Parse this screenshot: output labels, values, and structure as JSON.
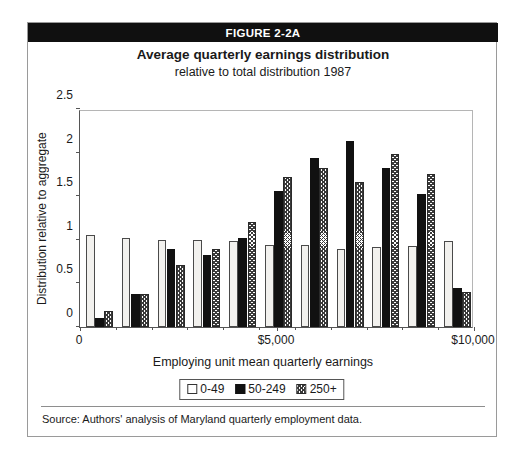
{
  "figure": {
    "header_label": "FIGURE 2-2A",
    "title": "Average quarterly earnings distribution",
    "subtitle": "relative to total distribution 1987",
    "source_note": "Source: Authors' analysis of Maryland quarterly employment data."
  },
  "colors": {
    "header_background": "#101010",
    "header_text": "#ffffff",
    "series_0_49": "#f2f1ee",
    "series_50_249": "#111111",
    "series_250_plus": "#9a9a9a",
    "axis": "#555555",
    "plot_border": "#b5b5b5",
    "box_border": "#9a9a9a"
  },
  "chart_data": {
    "type": "bar",
    "title": "Average quarterly earnings distribution",
    "subtitle": "relative to total distribution 1987",
    "xlabel": "Employing unit mean quarterly earnings",
    "ylabel": "Distribution relative to aggregate",
    "ylim": [
      0,
      2.5
    ],
    "yticks": [
      0,
      0.5,
      1,
      1.5,
      2,
      2.5
    ],
    "ytick_labels": [
      "0",
      "0.5",
      "1",
      "1.5",
      "2",
      "2.5"
    ],
    "xlim": [
      0,
      11
    ],
    "xticks": [
      0,
      5.5,
      11
    ],
    "xtick_labels": [
      "0",
      "$5,000",
      "$10,000"
    ],
    "grid": false,
    "legend_position": "bottom",
    "categories": [
      "0-1000",
      "1000-2000",
      "2000-3000",
      "3000-4000",
      "4000-5000",
      "5000-6000",
      "6000-7000",
      "7000-8000",
      "8000-9000",
      "9000-10000",
      "10000+"
    ],
    "series": [
      {
        "name": "0-49",
        "values": [
          1.05,
          1.02,
          1.0,
          1.0,
          0.99,
          0.94,
          0.94,
          0.9,
          0.92,
          0.93,
          0.99
        ]
      },
      {
        "name": "50-249",
        "values": [
          0.1,
          0.38,
          0.89,
          0.83,
          1.02,
          1.56,
          1.94,
          2.13,
          1.82,
          1.53,
          0.45
        ]
      },
      {
        "name": "250+",
        "values": [
          0.18,
          0.38,
          0.71,
          0.9,
          1.21,
          1.72,
          1.82,
          1.66,
          1.98,
          1.76,
          0.4
        ]
      }
    ]
  }
}
